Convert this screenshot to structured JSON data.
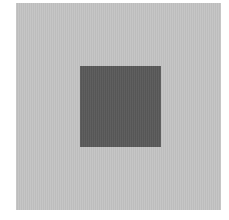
{
  "figure": {
    "background_color": "#ffffff",
    "outer_square": {
      "color": "#c3c3c3",
      "label": ""
    },
    "inner_square": {
      "color": "#595959",
      "label": ""
    }
  }
}
